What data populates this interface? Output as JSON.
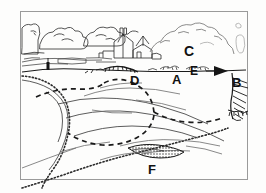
{
  "figure": {
    "type": "landscape-sketch-map",
    "medium": "pen-and-ink line drawing",
    "palette": {
      "ink": "#1a1a1a",
      "paper": "#fdfdfc",
      "frame": "#9a9a9a",
      "faint_ink": "#8c8c8c"
    },
    "frame": {
      "x": 20,
      "y": 11,
      "width": 228,
      "height": 169
    }
  },
  "scene": {
    "subject": "river valley with large meander loop, floodplain terraces and a village on the far bank",
    "horizon_y": 78,
    "regions": [
      {
        "name": "wooded-skyline",
        "description": "line of rounded deciduous trees along the far left skyline"
      },
      {
        "name": "village",
        "description": "cluster of farm buildings with chimney and pitched roofs at centre"
      },
      {
        "name": "hill-slope",
        "description": "rounded hill rising on the right side of the valley"
      },
      {
        "name": "floodplain",
        "description": "open flat floodplain inside the meander loop"
      },
      {
        "name": "river-channel",
        "description": "broad meander sweeping from left edge round to the right"
      },
      {
        "name": "bluff",
        "description": "steep hachured cliff cutting the right-hand edge"
      }
    ]
  },
  "labels": [
    {
      "id": "A",
      "text": "A",
      "x": 172,
      "y": 73,
      "target": "river-terrace-surface"
    },
    {
      "id": "B",
      "text": "B",
      "x": 232,
      "y": 76,
      "target": "arrowhead-marker-right-bank"
    },
    {
      "id": "C",
      "text": "C",
      "x": 184,
      "y": 44,
      "target": "hill-slope-above-valley"
    },
    {
      "id": "D",
      "text": "D",
      "x": 130,
      "y": 74,
      "target": "hachured-scarp-edge"
    },
    {
      "id": "E",
      "text": "E",
      "x": 190,
      "y": 65,
      "target": "low-scrub-hedge-line"
    },
    {
      "id": "F",
      "text": "F",
      "x": 148,
      "y": 163,
      "target": "stippled-gravel-bar"
    }
  ],
  "markers": [
    {
      "name": "post-marker",
      "x": 48,
      "y": 66,
      "description": "small dark vertical post on the left bank terrace"
    },
    {
      "name": "arrowhead-marker",
      "x": 222,
      "y": 70,
      "description": "solid black triangular arrowhead pointing right"
    }
  ],
  "line_styles": [
    {
      "name": "solid-outline",
      "description": "continuous black contour lines for ridges, banks and buildings"
    },
    {
      "name": "dashed-path",
      "description": "long dashed line tracing a path across the floodplain"
    },
    {
      "name": "stipple-bank",
      "description": "dotted stippled line marking the outer river bank"
    },
    {
      "name": "hachure",
      "description": "short parallel ticks indicating steep slope faces"
    }
  ]
}
